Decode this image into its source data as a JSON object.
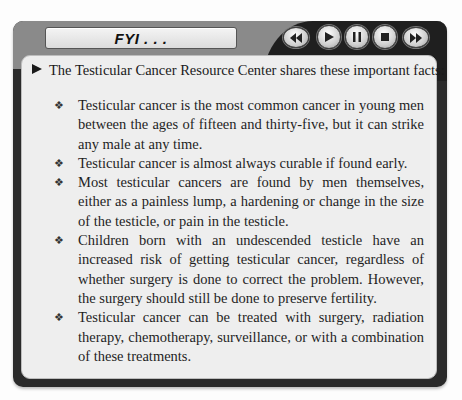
{
  "header": {
    "title": "FYI . . .",
    "controls": [
      {
        "name": "rewind-button",
        "icon": "rewind-icon"
      },
      {
        "name": "play-button",
        "icon": "play-icon"
      },
      {
        "name": "pause-button",
        "icon": "pause-icon"
      },
      {
        "name": "stop-button",
        "icon": "stop-icon"
      },
      {
        "name": "fast-forward-button",
        "icon": "fast-forward-icon"
      }
    ]
  },
  "content": {
    "intro": "The Testicular Cancer Resource Center shares these important facts:",
    "bullet_glyph": "❖",
    "facts": [
      "Testicular cancer is the most common cancer in young men between the ages of fifteen and thirty-five, but it can strike any male at any time.",
      "Testicular cancer is almost always curable if found early.",
      "Most testicular cancers are found by men themselves, either as a painless lump, a hardening or change in the size of the testi­cle, or pain in the testicle.",
      "Children born with an undescended testicle have an increased risk of getting testicular cancer, regardless of whether surgery is done to correct the problem. However, the surgery should still be done to preserve fertility.",
      "Testicular cancer can be treated with surgery, radiation therapy, chemotherapy, surveillance, or with a combination of these treatments."
    ]
  },
  "colors": {
    "frame_dark": "#2a2a2a",
    "frame_grey": "#8a8a8a",
    "panel_bg": "#eeeeee"
  }
}
